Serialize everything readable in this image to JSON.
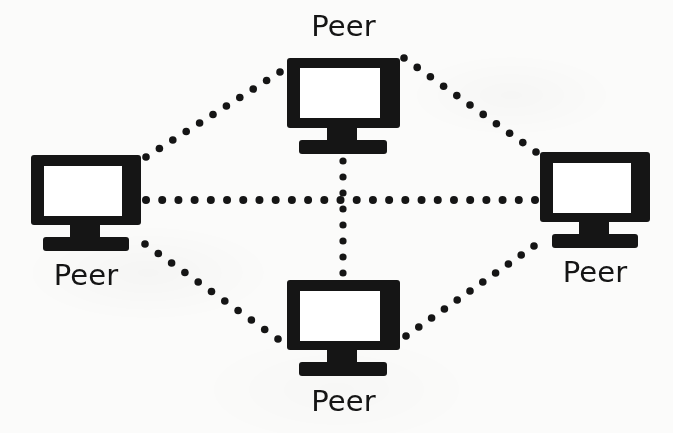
{
  "figure": {
    "kind": "network-topology-diagram",
    "topology": "peer-to-peer mesh",
    "background_color": "#fbfbfa",
    "ink_color": "#151515",
    "screen_color": "#ffffff",
    "width": 673,
    "height": 433
  },
  "nodes": [
    {
      "id": "peer-top",
      "label": "Peer",
      "icon": "desktop-monitor-icon",
      "position": "top",
      "label_position": "above",
      "bezel": {
        "x": 287,
        "y": 58,
        "w": 113,
        "h": 70
      },
      "screen": {
        "x": 300,
        "y": 68,
        "w": 80,
        "h": 50
      },
      "neck": {
        "x": 327,
        "y": 128,
        "w": 30,
        "h": 14
      },
      "base": {
        "x": 299,
        "y": 140,
        "w": 88,
        "h": 14
      }
    },
    {
      "id": "peer-left",
      "label": "Peer",
      "icon": "desktop-monitor-icon",
      "position": "left",
      "label_position": "below",
      "bezel": {
        "x": 31,
        "y": 155,
        "w": 110,
        "h": 70
      },
      "screen": {
        "x": 44,
        "y": 166,
        "w": 78,
        "h": 50
      },
      "neck": {
        "x": 70,
        "y": 225,
        "w": 30,
        "h": 14
      },
      "base": {
        "x": 43,
        "y": 237,
        "w": 86,
        "h": 14
      }
    },
    {
      "id": "peer-right",
      "label": "Peer",
      "icon": "desktop-monitor-icon",
      "position": "right",
      "label_position": "below",
      "bezel": {
        "x": 540,
        "y": 152,
        "w": 110,
        "h": 70
      },
      "screen": {
        "x": 553,
        "y": 163,
        "w": 78,
        "h": 50
      },
      "neck": {
        "x": 579,
        "y": 222,
        "w": 30,
        "h": 14
      },
      "base": {
        "x": 552,
        "y": 234,
        "w": 86,
        "h": 14
      }
    },
    {
      "id": "peer-bottom",
      "label": "Peer",
      "icon": "desktop-monitor-icon",
      "position": "bottom",
      "label_position": "below",
      "bezel": {
        "x": 287,
        "y": 280,
        "w": 113,
        "h": 70
      },
      "screen": {
        "x": 300,
        "y": 291,
        "w": 80,
        "h": 50
      },
      "neck": {
        "x": 327,
        "y": 350,
        "w": 30,
        "h": 14
      },
      "base": {
        "x": 299,
        "y": 362,
        "w": 88,
        "h": 14
      }
    }
  ],
  "links": [
    {
      "id": "link-left-right",
      "from": "peer-left",
      "to": "peer-right",
      "style": "dotted",
      "x1": 146,
      "y1": 200,
      "x2": 535,
      "y2": 200,
      "dot_radius": 4.0,
      "dot_gap": 16.5
    },
    {
      "id": "link-top-bottom",
      "from": "peer-top",
      "to": "peer-bottom",
      "style": "dotted",
      "x1": 343,
      "y1": 161,
      "x2": 343,
      "y2": 273,
      "dot_radius": 3.6,
      "dot_gap": 16.0
    },
    {
      "id": "link-left-top",
      "from": "peer-left",
      "to": "peer-top",
      "style": "dotted",
      "x1": 146,
      "y1": 157,
      "x2": 280,
      "y2": 72,
      "dot_radius": 3.8,
      "dot_gap": 16.0
    },
    {
      "id": "link-top-right",
      "from": "peer-top",
      "to": "peer-right",
      "style": "dotted",
      "x1": 404,
      "y1": 58,
      "x2": 536,
      "y2": 152,
      "dot_radius": 3.8,
      "dot_gap": 16.0
    },
    {
      "id": "link-left-bottom",
      "from": "peer-left",
      "to": "peer-bottom",
      "style": "dotted",
      "x1": 145,
      "y1": 244,
      "x2": 278,
      "y2": 339,
      "dot_radius": 3.8,
      "dot_gap": 16.0
    },
    {
      "id": "link-bottom-right",
      "from": "peer-bottom",
      "to": "peer-right",
      "style": "dotted",
      "x1": 406,
      "y1": 336,
      "x2": 534,
      "y2": 246,
      "dot_radius": 3.8,
      "dot_gap": 16.0
    }
  ],
  "labels": {
    "top": "Peer",
    "left": "Peer",
    "right": "Peer",
    "bottom": "Peer"
  }
}
